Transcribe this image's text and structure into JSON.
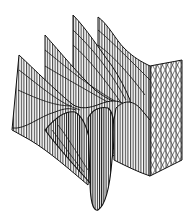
{
  "figure": {
    "type": "3d-wireframe-surface",
    "background": "#ffffff",
    "line_color": "#1a1a1a",
    "text_labels": []
  }
}
